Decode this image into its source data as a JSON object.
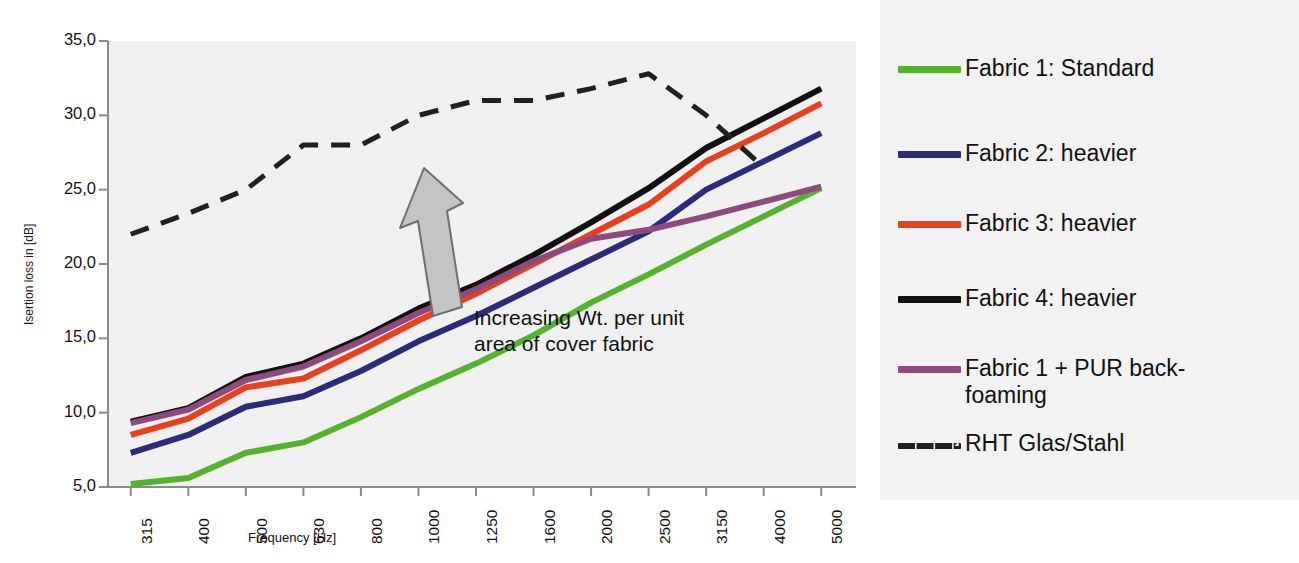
{
  "chart_data": {
    "type": "line",
    "title": "",
    "xlabel": "Frequency [Hz]",
    "ylabel": "Isertion loss in [dB]",
    "categories": [
      "315",
      "400",
      "500",
      "630",
      "800",
      "1000",
      "1250",
      "1600",
      "2000",
      "2500",
      "3150",
      "4000",
      "5000"
    ],
    "ylim": [
      5.0,
      35.0
    ],
    "ytick_labels": [
      "5,0",
      "10,0",
      "15,0",
      "20,0",
      "25,0",
      "30,0",
      "35,0"
    ],
    "ytick_values": [
      5.0,
      10.0,
      15.0,
      20.0,
      25.0,
      30.0,
      35.0
    ],
    "grid": false,
    "legend_position": "right",
    "series": [
      {
        "name": "Fabric 1: Standard",
        "color": "#55b22e",
        "style": "solid",
        "values": [
          5.2,
          5.6,
          7.3,
          8.0,
          9.7,
          11.6,
          13.3,
          15.2,
          17.4,
          19.3,
          21.3,
          23.2,
          25.1
        ]
      },
      {
        "name": "Fabric 2: heavier",
        "color": "#2b2b7a",
        "style": "solid",
        "values": [
          7.3,
          8.5,
          10.4,
          11.1,
          12.8,
          14.8,
          16.5,
          18.4,
          20.3,
          22.2,
          25.0,
          26.9,
          28.8
        ]
      },
      {
        "name": "Fabric 3: heavier",
        "color": "#e8401a",
        "style": "solid",
        "values": [
          8.5,
          9.6,
          11.7,
          12.3,
          14.2,
          16.2,
          18.0,
          20.0,
          22.0,
          24.0,
          26.9,
          28.8,
          30.8
        ]
      },
      {
        "name": "Fabric 4:  heavier",
        "color": "#111111",
        "style": "solid",
        "values": [
          9.4,
          10.3,
          12.4,
          13.3,
          15.0,
          17.0,
          18.6,
          20.6,
          22.8,
          25.1,
          27.8,
          29.8,
          31.8
        ]
      },
      {
        "name": "Fabric 1 + PUR back-\nfoaming",
        "color": "#8e4a7e",
        "style": "solid",
        "values": [
          9.3,
          10.2,
          12.2,
          13.1,
          14.8,
          16.7,
          18.3,
          20.2,
          21.7,
          22.3,
          23.2,
          24.2,
          25.2
        ]
      },
      {
        "name": "RHT Glas/Stahl",
        "color": "#202020",
        "style": "dashed",
        "values": [
          22.0,
          23.4,
          25.0,
          28.0,
          28.0,
          30.0,
          31.0,
          31.0,
          31.8,
          32.8,
          30.0,
          26.5,
          null
        ]
      }
    ],
    "annotations": [
      {
        "name": "increasing-weight-note",
        "text": "Increasing Wt. per unit\narea of cover fabric",
        "arrow": "up-left-arrow",
        "arrow_color": "#bdbdbd"
      }
    ]
  },
  "axes": {
    "y_title": "Isertion loss in [dB]",
    "x_title": "Frequency [Hz]"
  }
}
